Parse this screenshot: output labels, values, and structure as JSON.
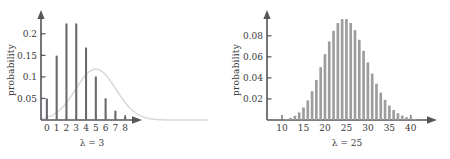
{
  "figure": {
    "title": "",
    "panel_count": 2,
    "background_color": "#ffffff",
    "bar_color_left": "#6a6a6e",
    "bar_color_right": "#9d9d9d",
    "axis_color": "#55555a",
    "curve_color": "#d8d8d8"
  },
  "chart_data": [
    {
      "type": "bar",
      "title": "",
      "xlabel": "λ = 3",
      "ylabel": "probability",
      "categories": [
        0,
        1,
        2,
        3,
        4,
        5,
        6,
        7,
        8
      ],
      "values": [
        0.0498,
        0.1494,
        0.224,
        0.224,
        0.168,
        0.1008,
        0.0504,
        0.0216,
        0.0081
      ],
      "xtick_labels": [
        "0",
        "1",
        "2",
        "3",
        "4",
        "5",
        "6",
        "7",
        "8"
      ],
      "ytick_labels": [
        "0.05",
        "0.1",
        "0.15",
        "0.2"
      ],
      "ytick_values": [
        0.05,
        0.1,
        0.15,
        0.2
      ],
      "xlim": [
        -0.6,
        8.9
      ],
      "ylim": [
        0,
        0.232
      ],
      "grid": false,
      "legend": null,
      "annotation": "normal approximation curve overlaid in light gray",
      "overlay_curve": {
        "type": "line",
        "mean": 5.0,
        "peak_value": 0.118,
        "sigma": 2.05,
        "color": "#d8d8d8"
      }
    },
    {
      "type": "bar",
      "title": "",
      "xlabel": "λ = 25",
      "ylabel": "probability",
      "categories": [
        9,
        10,
        11,
        12,
        13,
        14,
        15,
        16,
        17,
        18,
        19,
        20,
        21,
        22,
        23,
        24,
        25,
        26,
        27,
        28,
        29,
        30,
        31,
        32,
        33,
        34,
        35,
        36,
        37,
        38,
        39,
        40,
        41
      ],
      "values": [
        0.0002,
        0.0004,
        0.001,
        0.0021,
        0.004,
        0.0072,
        0.0119,
        0.0186,
        0.0274,
        0.0381,
        0.0501,
        0.0626,
        0.0746,
        0.0847,
        0.0921,
        0.0959,
        0.0959,
        0.0922,
        0.0854,
        0.0762,
        0.0657,
        0.0547,
        0.0441,
        0.0345,
        0.0261,
        0.0192,
        0.0137,
        0.0095,
        0.0064,
        0.0042,
        0.0027,
        0.0017,
        0.001
      ],
      "xtick_labels": [
        "10",
        "15",
        "20",
        "25",
        "30",
        "35",
        "40"
      ],
      "xtick_values": [
        10,
        15,
        20,
        25,
        30,
        35,
        40
      ],
      "ytick_labels": [
        "0.02",
        "0.04",
        "0.06",
        "0.08"
      ],
      "ytick_values": [
        0.02,
        0.04,
        0.06,
        0.08
      ],
      "xlim": [
        6.5,
        44
      ],
      "ylim": [
        0,
        0.095
      ],
      "grid": false,
      "legend": null
    }
  ]
}
